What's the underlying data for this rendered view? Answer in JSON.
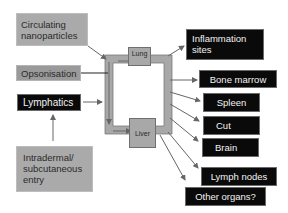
{
  "diagram": {
    "sources": {
      "circulating": "Circulating nanoparticles",
      "circulating_line1": "Circulating",
      "circulating_line2": "nanoparticles",
      "opsonisation": "Opsonisation",
      "lymphatics": "Lymphatics",
      "intradermal_line1": "Intradermal/",
      "intradermal_line2": "subcutaneous",
      "intradermal_line3": "entry"
    },
    "circuit": {
      "lung": "Lung",
      "liver": "Liver"
    },
    "destinations": [
      {
        "line1": "Inflammation",
        "line2": "sites"
      },
      {
        "label": "Bone marrow"
      },
      {
        "label": "Spleen"
      },
      {
        "label": "Cut"
      },
      {
        "label": "Brain"
      },
      {
        "label": "Lymph nodes"
      },
      {
        "label": "Other organs?"
      }
    ],
    "colors": {
      "source_gray": "#aaaaaa",
      "opsonisation_gray": "#9a9a9a",
      "destination_black": "#0a0a0a",
      "pipe_gray": "#a8a8a8",
      "arrow": "#666666"
    }
  }
}
